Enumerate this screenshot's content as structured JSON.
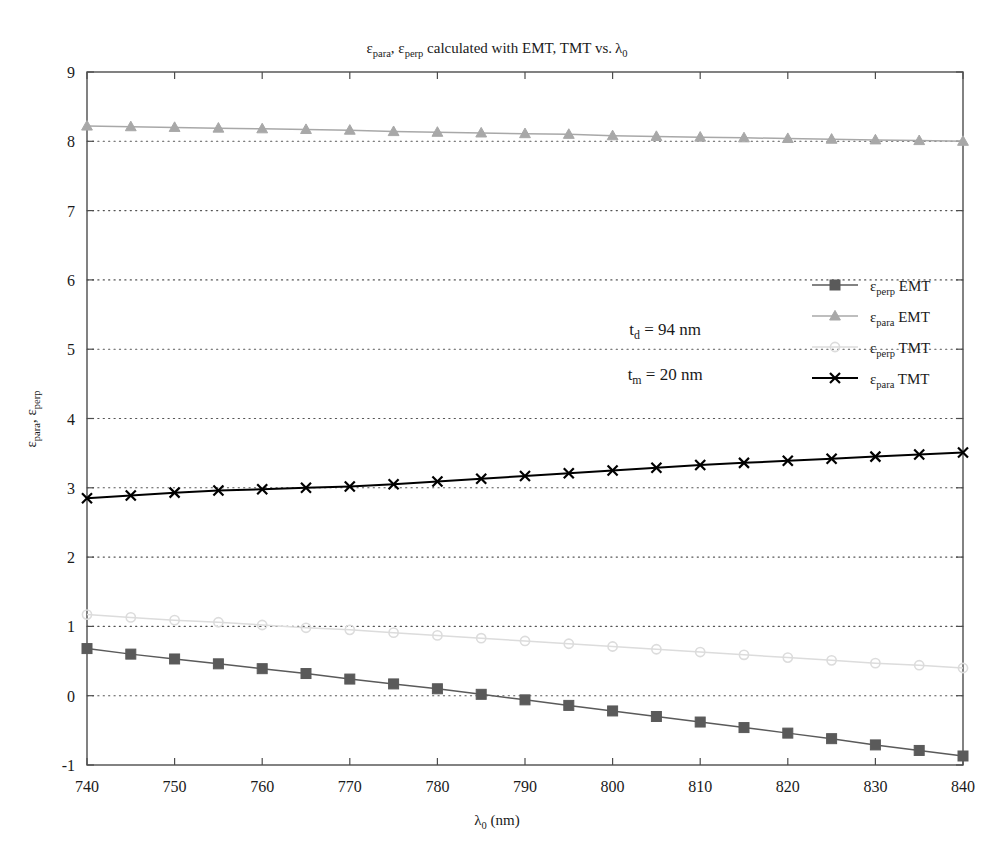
{
  "chart_data": {
    "type": "line",
    "title_parts": {
      "eps1": "ε",
      "sub1": "para",
      "comma": ", ",
      "eps2": "ε",
      "sub2": "perp",
      "middle": " calculated with EMT, TMT vs. ",
      "lambda": "λ",
      "sub3": "0"
    },
    "xlabel": "λ₀ (nm)",
    "xlabel_parts": {
      "lambda": "λ",
      "sub": "0",
      "units": " (nm)"
    },
    "ylabel": "ε_para, ε_perp",
    "ylabel_parts": {
      "eps1": "ε",
      "sub1": "para",
      "comma": ", ",
      "eps2": "ε",
      "sub2": "perp"
    },
    "xlim": [
      740,
      840
    ],
    "ylim": [
      -1,
      9
    ],
    "xticks": [
      740,
      750,
      760,
      770,
      780,
      790,
      800,
      810,
      820,
      830,
      840
    ],
    "yticks": [
      -1,
      0,
      1,
      2,
      3,
      4,
      5,
      6,
      7,
      8,
      9
    ],
    "grid": "dotted-horizontal",
    "legend_position": "center-right",
    "x": [
      740,
      745,
      750,
      755,
      760,
      765,
      770,
      775,
      780,
      785,
      790,
      795,
      800,
      805,
      810,
      815,
      820,
      825,
      830,
      835,
      840
    ],
    "series": [
      {
        "name": "ε_perp EMT",
        "label_parts": {
          "eps": "ε",
          "sub": "perp",
          "tail": " EMT"
        },
        "color": "#5a5a5a",
        "marker": "square",
        "linestyle": "solid",
        "values": [
          0.68,
          0.6,
          0.53,
          0.46,
          0.39,
          0.32,
          0.24,
          0.17,
          0.1,
          0.02,
          -0.06,
          -0.14,
          -0.22,
          -0.3,
          -0.38,
          -0.46,
          -0.54,
          -0.62,
          -0.71,
          -0.79,
          -0.87
        ]
      },
      {
        "name": "ε_para EMT",
        "label_parts": {
          "eps": "ε",
          "sub": "para",
          "tail": " EMT"
        },
        "color": "#a8a8a8",
        "marker": "triangle",
        "linestyle": "solid",
        "values": [
          8.22,
          8.21,
          8.2,
          8.19,
          8.18,
          8.17,
          8.16,
          8.14,
          8.13,
          8.12,
          8.11,
          8.1,
          8.08,
          8.07,
          8.06,
          8.05,
          8.04,
          8.03,
          8.02,
          8.01,
          8.0
        ]
      },
      {
        "name": "ε_perp TMT",
        "label_parts": {
          "eps": "ε",
          "sub": "perp",
          "tail": " TMT"
        },
        "color": "#dcdcdc",
        "marker": "circle",
        "linestyle": "solid",
        "values": [
          1.17,
          1.13,
          1.09,
          1.06,
          1.02,
          0.98,
          0.95,
          0.91,
          0.87,
          0.83,
          0.79,
          0.75,
          0.71,
          0.67,
          0.63,
          0.59,
          0.55,
          0.51,
          0.47,
          0.44,
          0.4
        ]
      },
      {
        "name": "ε_para TMT",
        "label_parts": {
          "eps": "ε",
          "sub": "para",
          "tail": " TMT"
        },
        "color": "#000000",
        "marker": "x",
        "linestyle": "solid",
        "values": [
          2.85,
          2.89,
          2.93,
          2.96,
          2.98,
          3.0,
          3.02,
          3.05,
          3.09,
          3.13,
          3.17,
          3.21,
          3.25,
          3.29,
          3.33,
          3.36,
          3.39,
          3.42,
          3.45,
          3.48,
          3.51
        ]
      }
    ],
    "annotations": [
      {
        "text": "t_d = 94 nm",
        "parts": {
          "t": "t",
          "sub": "d",
          "tail": " = 94 nm"
        },
        "x": 806,
        "y": 5.2
      },
      {
        "text": "t_m = 20 nm",
        "parts": {
          "t": "t",
          "sub": "m",
          "tail": " = 20 nm"
        },
        "x": 806,
        "y": 4.55
      }
    ]
  },
  "colors": {
    "axis": "#4d4d4d",
    "grid": "#555555",
    "background": "#ffffff",
    "text": "#1a1a1a"
  }
}
